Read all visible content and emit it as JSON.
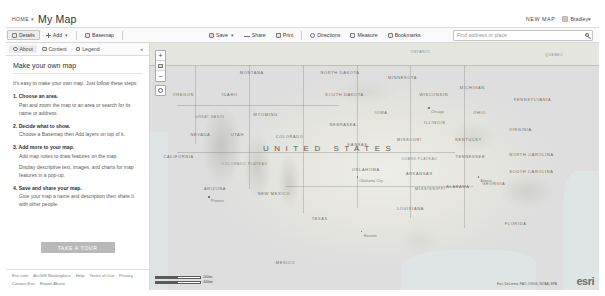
{
  "header": {
    "home_label": "HOME",
    "home_caret": "▾",
    "map_title": "My Map",
    "new_map_label": "NEW MAP",
    "user_name": "Bradley▾",
    "avatar_icon": "avatar-icon"
  },
  "toolbar": {
    "details_label": "Details",
    "add_label": "Add",
    "add_caret": "▾",
    "basemap_label": "Basemap",
    "save_label": "Save",
    "save_caret": "▾",
    "share_label": "Share",
    "print_label": "Print",
    "directions_label": "Directions",
    "measure_label": "Measure",
    "bookmarks_label": "Bookmarks",
    "search_placeholder": "Find address or place",
    "search_value": "",
    "search_icon": "search-icon"
  },
  "panel": {
    "tabs": [
      {
        "label": "About",
        "icon": "info-icon",
        "active": true
      },
      {
        "label": "Content",
        "icon": "layers-icon",
        "active": false
      },
      {
        "label": "Legend",
        "icon": "legend-icon",
        "active": false
      }
    ],
    "collapse_icon": "◂",
    "heading": "Make your own map",
    "intro": "It's easy to make your own map. Just follow these steps:",
    "steps": [
      {
        "title": "1. Choose an area.",
        "lines": [
          "Pan and zoom the map to an area or search for its name or address."
        ]
      },
      {
        "title": "2. Decide what to show.",
        "lines": [
          "Choose a Basemap then Add layers on top of it."
        ]
      },
      {
        "title": "3. Add more to your map.",
        "lines": [
          "Add map notes to draw features on the map.",
          "Display descriptive text, images, and charts for map features in a pop-up."
        ]
      },
      {
        "title": "4. Save and share your map.",
        "lines": [
          "Give your map a name and description then share it with other people."
        ]
      }
    ],
    "tour_button": "TAKE A TOUR",
    "footer_links": [
      "Esri.com",
      "ArcGIS Marketplace",
      "Help",
      "Terms of Use",
      "Privacy",
      "Contact Esri",
      "Report Abuse"
    ]
  },
  "map": {
    "zoom_in": "+",
    "zoom_out": "−",
    "home_icon": "home-icon",
    "locate_icon": "locate-icon",
    "scale_miles": "200mi",
    "scale_km": "400km",
    "attribution": "Esri, DeLorme, FAO, USGS, NOAA, EPA",
    "logo": "esri",
    "country_label": "UNITED STATES",
    "labels": [
      {
        "text": "QUEBEC",
        "x": 88,
        "y": 4,
        "cls": "region"
      },
      {
        "text": "ONTARIO",
        "x": 58,
        "y": 3,
        "cls": "region"
      },
      {
        "text": "MONTANA",
        "x": 20,
        "y": 11,
        "cls": ""
      },
      {
        "text": "NORTH DAKOTA",
        "x": 38,
        "y": 11,
        "cls": ""
      },
      {
        "text": "MINNESOTA",
        "x": 53,
        "y": 13,
        "cls": ""
      },
      {
        "text": "MICHIGAN",
        "x": 69,
        "y": 17,
        "cls": ""
      },
      {
        "text": "OREGON",
        "x": 5,
        "y": 20,
        "cls": ""
      },
      {
        "text": "IDAHO",
        "x": 16,
        "y": 20,
        "cls": ""
      },
      {
        "text": "SOUTH DAKOTA",
        "x": 39,
        "y": 20,
        "cls": ""
      },
      {
        "text": "WISCONSIN",
        "x": 60,
        "y": 20,
        "cls": ""
      },
      {
        "text": "WYOMING",
        "x": 23,
        "y": 28,
        "cls": ""
      },
      {
        "text": "IOWA",
        "x": 50,
        "y": 27,
        "cls": ""
      },
      {
        "text": "NEBRASKA",
        "x": 40,
        "y": 32,
        "cls": ""
      },
      {
        "text": "ILLINOIS",
        "x": 61,
        "y": 31,
        "cls": ""
      },
      {
        "text": "OHIO",
        "x": 72,
        "y": 27,
        "cls": ""
      },
      {
        "text": "PENNSYLVANIA",
        "x": 81,
        "y": 22,
        "cls": ""
      },
      {
        "text": "NEVADA",
        "x": 9,
        "y": 36,
        "cls": ""
      },
      {
        "text": "UTAH",
        "x": 18,
        "y": 36,
        "cls": ""
      },
      {
        "text": "COLORADO",
        "x": 28,
        "y": 37,
        "cls": ""
      },
      {
        "text": "KANSAS",
        "x": 44,
        "y": 40,
        "cls": ""
      },
      {
        "text": "MISSOURI",
        "x": 55,
        "y": 38,
        "cls": ""
      },
      {
        "text": "KENTUCKY",
        "x": 68,
        "y": 38,
        "cls": ""
      },
      {
        "text": "VIRGINIA",
        "x": 80,
        "y": 34,
        "cls": ""
      },
      {
        "text": "CALIFORNIA",
        "x": 3,
        "y": 45,
        "cls": ""
      },
      {
        "text": "GREAT BASIN",
        "x": 10,
        "y": 29,
        "cls": "region"
      },
      {
        "text": "COLORADO PLATEAU",
        "x": 16,
        "y": 48,
        "cls": "region"
      },
      {
        "text": "ARIZONA",
        "x": 12,
        "y": 58,
        "cls": ""
      },
      {
        "text": "NEW MEXICO",
        "x": 24,
        "y": 60,
        "cls": ""
      },
      {
        "text": "OKLAHOMA",
        "x": 45,
        "y": 50,
        "cls": ""
      },
      {
        "text": "ARKANSAS",
        "x": 57,
        "y": 52,
        "cls": ""
      },
      {
        "text": "TENNESSEE",
        "x": 68,
        "y": 45,
        "cls": ""
      },
      {
        "text": "NORTH CAROLINA",
        "x": 80,
        "y": 44,
        "cls": ""
      },
      {
        "text": "SOUTH CAROLINA",
        "x": 80,
        "y": 51,
        "cls": ""
      },
      {
        "text": "GEORGIA",
        "x": 74,
        "y": 56,
        "cls": ""
      },
      {
        "text": "ALABAMA",
        "x": 66,
        "y": 57,
        "cls": ""
      },
      {
        "text": "MISSISSIPPI",
        "x": 59,
        "y": 58,
        "cls": ""
      },
      {
        "text": "LOUISIANA",
        "x": 55,
        "y": 66,
        "cls": ""
      },
      {
        "text": "TEXAS",
        "x": 36,
        "y": 70,
        "cls": ""
      },
      {
        "text": "OZARK PLATEAU",
        "x": 56,
        "y": 46,
        "cls": "region"
      },
      {
        "text": "FLORIDA",
        "x": 79,
        "y": 72,
        "cls": ""
      },
      {
        "text": "MEXICO",
        "x": 28,
        "y": 88,
        "cls": ""
      }
    ],
    "cities": [
      {
        "name": "Phoenix",
        "x": 13,
        "y": 62
      },
      {
        "name": "Oklahoma City",
        "x": 46,
        "y": 54
      },
      {
        "name": "Houston",
        "x": 47,
        "y": 76
      },
      {
        "name": "Chicago",
        "x": 62,
        "y": 26
      },
      {
        "name": "Atlanta",
        "x": 73,
        "y": 54
      }
    ]
  }
}
